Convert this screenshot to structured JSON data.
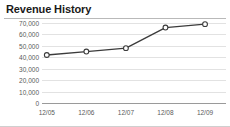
{
  "widget": {
    "title": "Revenue History"
  },
  "chart_data": {
    "type": "line",
    "title": "Revenue History",
    "xlabel": "",
    "ylabel": "",
    "categories": [
      "12/05",
      "12/06",
      "12/07",
      "12/08",
      "12/09"
    ],
    "values": [
      42000,
      45000,
      48000,
      66000,
      69000
    ],
    "series": [
      {
        "name": "Revenue",
        "values": [
          42000,
          45000,
          48000,
          66000,
          69000
        ]
      }
    ],
    "ylim": [
      0,
      70000
    ],
    "yticks": [
      0,
      10000,
      20000,
      30000,
      40000,
      50000,
      60000,
      70000
    ],
    "ytick_labels": [
      "0",
      "10,000",
      "20,000",
      "30,000",
      "40,000",
      "50,000",
      "60,000",
      "70,000"
    ],
    "xtick_labels": [
      "12/05",
      "12/06",
      "12/07",
      "12/08",
      "12/09"
    ],
    "grid": true,
    "legend": false,
    "marker": "circle-open",
    "line_color": "#3b3b3b",
    "grid_color": "#e2e2e2",
    "axis_color": "#9a9a9a",
    "label_color": "#5a5a5a"
  }
}
